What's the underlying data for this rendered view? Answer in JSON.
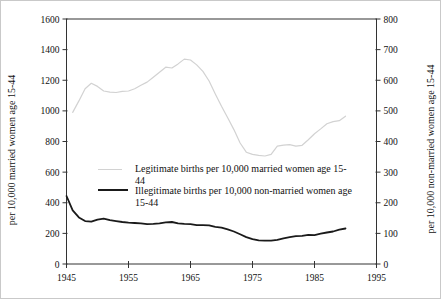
{
  "chart_data": {
    "type": "line",
    "title": "",
    "x_axis": {
      "label": "",
      "range": [
        1945,
        1995
      ],
      "ticks": [
        1945,
        1955,
        1965,
        1975,
        1985,
        1995
      ]
    },
    "left_y_axis": {
      "label": "per 10,000 married women age 15-44",
      "range": [
        0,
        1600
      ],
      "ticks": [
        0,
        200,
        400,
        600,
        800,
        1000,
        1200,
        1400,
        1600
      ]
    },
    "right_y_axis": {
      "label": "per 10,000 non-married women age 15-44",
      "range": [
        0,
        800
      ],
      "ticks": [
        0,
        100,
        200,
        300,
        400,
        500,
        600,
        700,
        800
      ]
    },
    "grid": "off",
    "legend_position": "inside-middle-left",
    "series": [
      {
        "name": "Legitimate births per 10,000 married women age 15-44",
        "axis": "left",
        "color": "#d2d2d2",
        "stroke_width": 1.2,
        "start_year": 1946,
        "values": [
          990,
          1065,
          1145,
          1180,
          1160,
          1130,
          1122,
          1120,
          1128,
          1130,
          1145,
          1168,
          1188,
          1220,
          1252,
          1285,
          1280,
          1307,
          1338,
          1332,
          1300,
          1258,
          1195,
          1110,
          1030,
          955,
          878,
          790,
          730,
          716,
          710,
          705,
          716,
          770,
          776,
          780,
          770,
          775,
          812,
          850,
          882,
          916,
          930,
          936,
          965
        ]
      },
      {
        "name": "Illegitimate births per 10,000 non-married women age 15-44",
        "axis": "right",
        "color": "#1a1a1a",
        "stroke_width": 1.8,
        "start_year": 1945,
        "values": [
          222,
          175,
          152,
          140,
          138,
          145,
          148,
          143,
          140,
          137,
          135,
          134,
          133,
          130,
          131,
          133,
          136,
          137,
          133,
          131,
          130,
          127,
          127,
          126,
          121,
          119,
          113,
          106,
          97,
          88,
          81,
          77,
          76,
          76,
          79,
          84,
          88,
          91,
          92,
          95,
          94,
          99,
          103,
          106,
          112,
          116
        ]
      }
    ],
    "legend": {
      "entries": [
        {
          "lines": [
            "Legitimate births per 10,000 married women age 15-",
            "44"
          ]
        },
        {
          "lines": [
            "Illegitimate births per 10,000 non-married women age",
            "15-44"
          ]
        }
      ]
    }
  }
}
